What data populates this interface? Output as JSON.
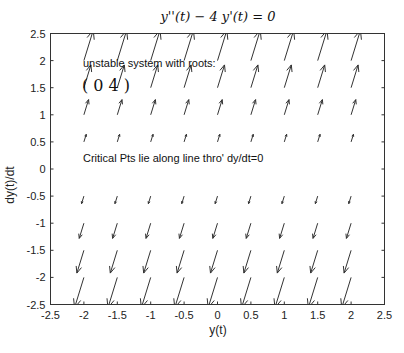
{
  "chart_data": {
    "type": "quiver",
    "title": "y''(t) − 4 y'(t) = 0",
    "xlabel": "y(t)",
    "ylabel": "dy(t)/dt",
    "xlim": [
      -2.5,
      2.5
    ],
    "ylim": [
      -2.5,
      2.5
    ],
    "xticks": [
      "-2.5",
      "-2",
      "-1.5",
      "-1",
      "-0.5",
      "0",
      "0.5",
      "1",
      "1.5",
      "2",
      "2.5"
    ],
    "yticks": [
      "2.5",
      "2",
      "1.5",
      "1",
      "0.5",
      "0",
      "-0.5",
      "-1",
      "-1.5",
      "-2",
      "-2.5"
    ],
    "grid": false,
    "field": {
      "dx": "dy",
      "dy": "4*dy",
      "x_points": [
        -2,
        -1.5,
        -1,
        -0.5,
        0,
        0.5,
        1,
        1.5,
        2
      ],
      "y_points": [
        2.5,
        2,
        1.5,
        1,
        0.5,
        0,
        -0.5,
        -1,
        -1.5,
        -2,
        -2.5
      ],
      "scale": 0.07
    },
    "annotations": [
      {
        "text": "unstable system with roots:",
        "x": -2.15,
        "y": 1.95
      },
      {
        "text": "( 0   4 )",
        "x": -2.15,
        "y": 1.5
      },
      {
        "text": "Critical Pts lie  along line thro' dy/dt=0",
        "x": -2.15,
        "y": 0.15
      }
    ]
  }
}
